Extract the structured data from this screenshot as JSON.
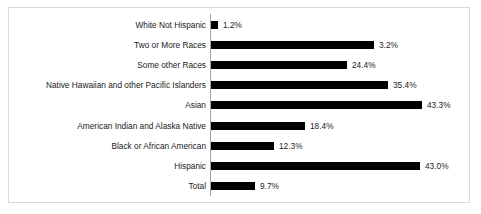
{
  "chart_data": {
    "type": "bar",
    "orientation": "horizontal",
    "title": "",
    "subtitle": "",
    "xlabel": "",
    "ylabel": "",
    "grid": false,
    "legend": "none",
    "axis_line": "vertical-left",
    "bar_color": "#000000",
    "background_color": "#ffffff",
    "border_color": "#d9d9d9",
    "text_color": "#1a1a1a",
    "categories": [
      "White Not Hispanic",
      "Two or More Races",
      "Some other Races",
      "Native Hawaiian and other Pacific Islanders",
      "Asian",
      "American Indian and Alaska Native",
      "Black or African American",
      "Hispanic",
      "Total"
    ],
    "values": [
      1.2,
      3.2,
      24.4,
      35.4,
      43.3,
      18.4,
      12.3,
      43.0,
      9.7
    ],
    "value_labels": [
      "1.2%",
      "3.2%",
      "24.4%",
      "35.4%",
      "43.3%",
      "18.4%",
      "12.3%",
      "43.0%",
      "9.7%"
    ],
    "bar_pixel_lengths": [
      7,
      163,
      136,
      177,
      211,
      94,
      63,
      209,
      44
    ],
    "rows": [
      {
        "category": "White Not Hispanic",
        "value": 1.2,
        "label": "1.2%",
        "bar_px": 7
      },
      {
        "category": "Two or More Races",
        "value": 3.2,
        "label": "3.2%",
        "bar_px": 163
      },
      {
        "category": "Some other Races",
        "value": 24.4,
        "label": "24.4%",
        "bar_px": 136
      },
      {
        "category": "Native Hawaiian and other Pacific Islanders",
        "value": 35.4,
        "label": "35.4%",
        "bar_px": 177
      },
      {
        "category": "Asian",
        "value": 43.3,
        "label": "43.3%",
        "bar_px": 211
      },
      {
        "category": "American Indian and Alaska Native",
        "value": 18.4,
        "label": "18.4%",
        "bar_px": 94
      },
      {
        "category": "Black or African American",
        "value": 12.3,
        "label": "12.3%",
        "bar_px": 63
      },
      {
        "category": "Hispanic",
        "value": 43.0,
        "label": "43.0%",
        "bar_px": 209
      },
      {
        "category": "Total",
        "value": 9.7,
        "label": "9.7%",
        "bar_px": 44
      }
    ]
  }
}
